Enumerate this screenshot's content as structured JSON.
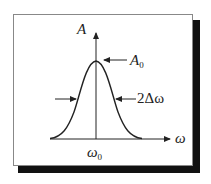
{
  "diagram": {
    "y_axis_label": "A",
    "x_axis_label": "ω",
    "peak_label": {
      "base": "A",
      "sub": "0"
    },
    "width_label": "2Δω",
    "center_label": {
      "base": "ω",
      "sub": "0"
    },
    "colors": {
      "line": "#222222",
      "frame": "#888888",
      "shadow": "#111111"
    }
  }
}
